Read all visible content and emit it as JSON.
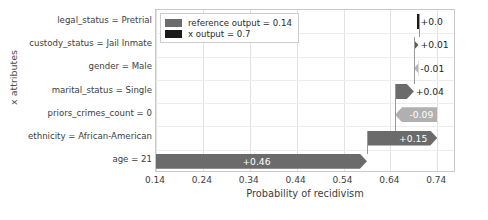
{
  "chart_data": {
    "type": "bar",
    "chart_style": "shap-force-waterfall",
    "title": "",
    "xlabel": "Probability of recidivism",
    "ylabel": "x attributes",
    "xlim": [
      0.14,
      0.78
    ],
    "xticks": [
      0.14,
      0.24,
      0.34,
      0.44,
      0.54,
      0.64,
      0.74
    ],
    "xticklabels": [
      "0.14",
      "0.24",
      "0.34",
      "0.44",
      "0.54",
      "0.64",
      "0.74"
    ],
    "grid": true,
    "legend_position": "upper left",
    "reference_output": 0.14,
    "x_output": 0.7,
    "categories": [
      "legal_status = Pretrial",
      "custody_status = Jail Inmate",
      "gender = Male",
      "marital_status = Single",
      "priors_crimes_count = 0",
      "ethnicity = African-American",
      "age = 21"
    ],
    "values": [
      0.0,
      0.01,
      -0.01,
      0.04,
      -0.09,
      0.15,
      0.46
    ],
    "value_labels": [
      "+0.0",
      "+0.01",
      "-0.01",
      "+0.04",
      "-0.09",
      "+0.15",
      "+0.46"
    ],
    "bars": [
      {
        "label": "legal_status = Pretrial",
        "value": 0.0,
        "value_label": "+0.0",
        "start": 0.7,
        "end": 0.7,
        "direction": "positive",
        "color": "#1a1a1a",
        "label_inside": false
      },
      {
        "label": "custody_status = Jail Inmate",
        "value": 0.01,
        "value_label": "+0.01",
        "start": 0.69,
        "end": 0.7,
        "direction": "positive",
        "color": "#5d5d5d",
        "label_inside": false
      },
      {
        "label": "gender = Male",
        "value": -0.01,
        "value_label": "-0.01",
        "start": 0.69,
        "end": 0.7,
        "direction": "negative",
        "color": "#b5b5b5",
        "label_inside": false
      },
      {
        "label": "marital_status = Single",
        "value": 0.04,
        "value_label": "+0.04",
        "start": 0.65,
        "end": 0.69,
        "direction": "positive",
        "color": "#6b6b6b",
        "label_inside": false
      },
      {
        "label": "priors_crimes_count = 0",
        "value": -0.09,
        "value_label": "-0.09",
        "start": 0.65,
        "end": 0.74,
        "direction": "negative",
        "color": "#b0b0b0",
        "label_inside": true
      },
      {
        "label": "ethnicity = African-American",
        "value": 0.15,
        "value_label": "+0.15",
        "start": 0.59,
        "end": 0.74,
        "direction": "positive",
        "color": "#6b6b6b",
        "label_inside": true
      },
      {
        "label": "age = 21",
        "value": 0.46,
        "value_label": "+0.46",
        "start": 0.14,
        "end": 0.59,
        "direction": "positive",
        "color": "#6b6b6b",
        "label_inside": true
      }
    ]
  },
  "legend": {
    "items": [
      {
        "label": "reference output = 0.14",
        "color": "#6b6b6b"
      },
      {
        "label": "x output = 0.7",
        "color": "#1a1a1a"
      }
    ]
  },
  "axes": {
    "xlabel": "Probability of recidivism",
    "ylabel": "x attributes"
  },
  "colors": {
    "positive_bar": "#6b6b6b",
    "negative_bar": "#b0b0b0",
    "output_bar": "#1a1a1a",
    "grid": "#e2e2e2",
    "frame": "#c9c9c9",
    "text": "#3d3d3d"
  }
}
